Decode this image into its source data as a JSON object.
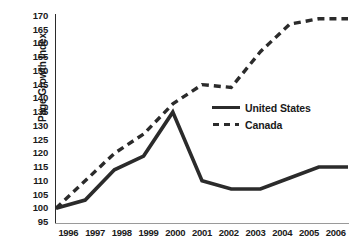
{
  "chart_data": {
    "type": "line",
    "title": "",
    "xlabel": "",
    "ylabel": "Page Growth Index",
    "categories": [
      "1996",
      "1997",
      "1998",
      "1999",
      "2000",
      "2001",
      "2002",
      "2003",
      "2004",
      "2005",
      "2006"
    ],
    "ylim": [
      95,
      170
    ],
    "ytick_step": 5,
    "yticks": [
      170,
      165,
      160,
      155,
      150,
      145,
      140,
      135,
      130,
      125,
      120,
      115,
      110,
      105,
      100,
      95
    ],
    "grid": false,
    "legend_position": "center-right",
    "series": [
      {
        "name": "United States",
        "style": "solid",
        "color": "#2b2b2b",
        "values": [
          100,
          103,
          114,
          119,
          135,
          110,
          107,
          107,
          111,
          115,
          115
        ]
      },
      {
        "name": "Canada",
        "style": "dashed",
        "color": "#2b2b2b",
        "values": [
          100,
          110,
          120,
          127,
          138,
          145,
          144,
          157,
          167,
          169,
          169
        ]
      }
    ]
  },
  "legend": {
    "items": [
      {
        "label": "United States",
        "swatch": "solid-line-swatch"
      },
      {
        "label": "Canada",
        "swatch": "dashed-line-swatch"
      }
    ]
  },
  "axes": {
    "y_title": "Page Growth Index"
  },
  "caption": ""
}
